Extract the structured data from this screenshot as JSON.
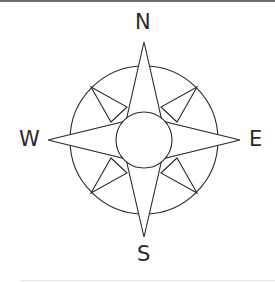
{
  "figure": {
    "labels": {
      "north": "N",
      "south": "S",
      "east": "E",
      "west": "W"
    },
    "colors": {
      "stroke": "#2a2a2a",
      "background": "#ffffff",
      "top_rule": "#6e6e6e"
    }
  }
}
